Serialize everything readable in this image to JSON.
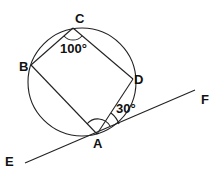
{
  "diagram": {
    "type": "circle-with-inscribed-quadrilateral-and-tangent",
    "points": {
      "A": "A",
      "B": "B",
      "C": "C",
      "D": "D",
      "E": "E",
      "F": "F"
    },
    "angles": {
      "angle_C": "100°",
      "angle_DAF": "30°"
    },
    "segments": [
      "AB",
      "BC",
      "CD",
      "DA"
    ],
    "tangent_line": "EF",
    "tangent_point": "A",
    "angle_arc_at_A": "BAD"
  }
}
